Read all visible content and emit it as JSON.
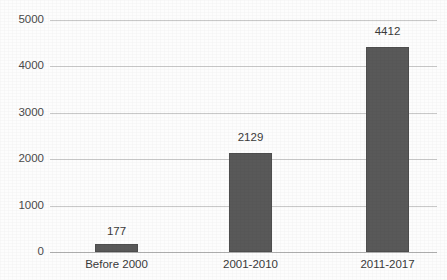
{
  "chart_data": {
    "type": "bar",
    "title": "",
    "xlabel": "",
    "ylabel": "",
    "categories": [
      "Before 2000",
      "2001-2010",
      "2011-2017"
    ],
    "values": [
      177,
      2129,
      4412
    ],
    "value_labels": [
      "177",
      "2129",
      "4412"
    ],
    "ylim": [
      0,
      5000
    ],
    "yticks": [
      0,
      1000,
      2000,
      3000,
      4000,
      5000
    ],
    "ytick_labels": [
      "0",
      "1000",
      "2000",
      "3000",
      "4000",
      "5000"
    ],
    "grid": "horizontal",
    "legend": "none",
    "series": [
      {
        "name": "",
        "values": [
          177,
          2129,
          4412
        ],
        "color": "#595959"
      }
    ],
    "colors": {
      "bar_fill": "#595959",
      "gridline": "#c9c9c9",
      "axis_line": "#b0b0b0",
      "text": "#3a3a3a",
      "background": "#fdfdfd"
    }
  }
}
